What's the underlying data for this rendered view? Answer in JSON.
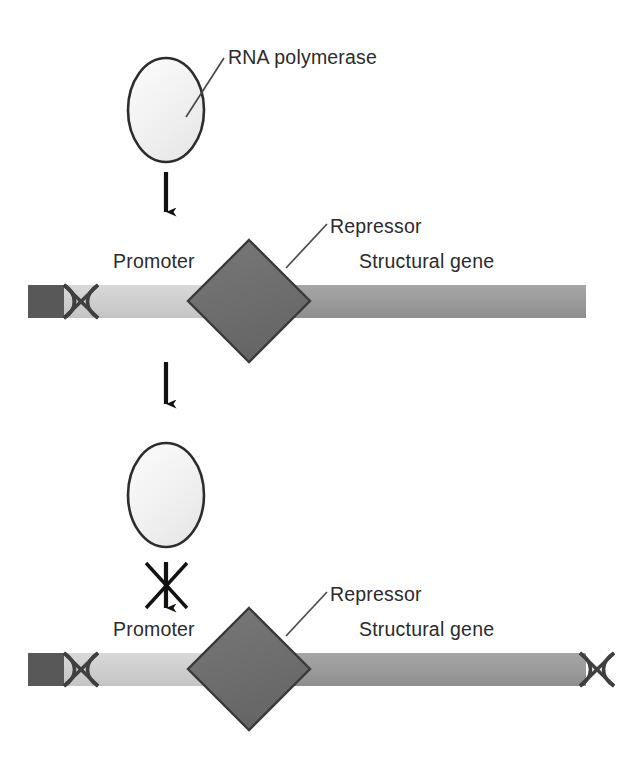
{
  "figure": {
    "background_color": "#ffffff",
    "width": 635,
    "height": 775
  },
  "labels": {
    "rna_polymerase": "RNA polymerase",
    "repressor": "Repressor",
    "promoter": "Promoter",
    "structural_gene": "Structural gene"
  },
  "colors": {
    "text": "#2b2b2b",
    "outline": "#1a1a1a",
    "polymerase_fill": "#f2f2f2",
    "promoter_fill": "#cfcfcf",
    "structural_gene_fill": "#9a9a9a",
    "operator_block_fill": "#585858",
    "repressor_fill": "#6e6e6e",
    "repressor_stroke": "#3a3a3a",
    "helix_stroke": "#3f3f3f",
    "arrow_color": "#111111"
  },
  "panels": [
    {
      "id": "panel-top",
      "name": "polymerase-approaching-blocked-promoter",
      "polymerase": {
        "cx": 166,
        "cy": 110,
        "rx": 38,
        "ry": 52
      },
      "arrow": {
        "x": 166,
        "y_start": 172,
        "y_end": 224,
        "blocked": false
      },
      "dna": {
        "y_top": 285,
        "height": 33,
        "x_start": 28,
        "x_end": 586,
        "operator_block": {
          "x": 28,
          "width": 36
        },
        "helix_left": {
          "x": 64,
          "width": 34
        },
        "helix_right": null,
        "promoter_region": {
          "x": 64,
          "width": 185
        },
        "structural_region": {
          "x": 249,
          "width": 337
        }
      },
      "repressor": {
        "cx": 249,
        "cy": 301,
        "half_diagonal": 61
      },
      "labels_shown": [
        "Repressor",
        "Promoter",
        "Structural gene"
      ]
    },
    {
      "id": "panel-bottom",
      "name": "polymerase-transcription-blocked",
      "polymerase": {
        "cx": 166,
        "cy": 495,
        "rx": 38,
        "ry": 52
      },
      "arrow": {
        "x": 166,
        "y_start": 560,
        "y_end": 616,
        "blocked": true
      },
      "dna": {
        "y_top": 653,
        "height": 33,
        "x_start": 28,
        "x_end": 586,
        "operator_block": {
          "x": 28,
          "width": 36
        },
        "helix_left": {
          "x": 64,
          "width": 34
        },
        "helix_right": {
          "x": 580,
          "width": 34
        },
        "promoter_region": {
          "x": 64,
          "width": 185
        },
        "structural_region": {
          "x": 249,
          "width": 337
        }
      },
      "repressor": {
        "cx": 249,
        "cy": 669,
        "half_diagonal": 61
      },
      "labels_shown": [
        "Repressor",
        "Promoter",
        "Structural gene"
      ]
    }
  ],
  "annotations": {
    "leader_rna_polymerase": {
      "from_x": 186,
      "from_y": 117,
      "to_x": 224,
      "to_y": 58
    },
    "leader_repressor_1": {
      "from_x": 286,
      "from_y": 268,
      "to_x": 327,
      "to_y": 224
    },
    "leader_repressor_2": {
      "from_x": 286,
      "from_y": 636,
      "to_x": 327,
      "to_y": 592
    },
    "block_symbol": "x-cross-over-arrow"
  }
}
